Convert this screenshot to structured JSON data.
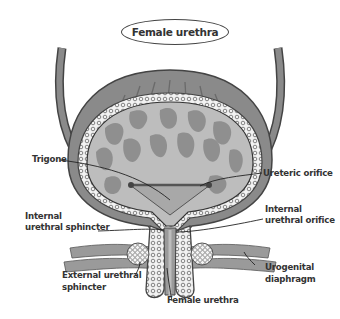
{
  "title": "Female urethra",
  "labels": {
    "trigone": "Trigone",
    "ureteric_orifice": "Ureteric orifice",
    "internal_urethral_sphincter_l1": "Internal",
    "internal_urethral_sphincter_l2": "urethral sphincter",
    "internal_urethral_orifice_l1": "Internal",
    "internal_urethral_orifice_l2": "urethral orifice",
    "external_urethral_sphincter_l1": "External urethral",
    "external_urethral_sphincter_l2": "sphincter",
    "urogenital_diaphragm_l1": "Urogenital",
    "urogenital_diaphragm_l2": "diaphragm",
    "female_urethra": "Female urethra"
  },
  "colors": {
    "outline": "#444444",
    "wall": "#8a8a8a",
    "lumen": "#bdbdbd",
    "rugae": "#8f8f8f",
    "text": "#333333"
  }
}
